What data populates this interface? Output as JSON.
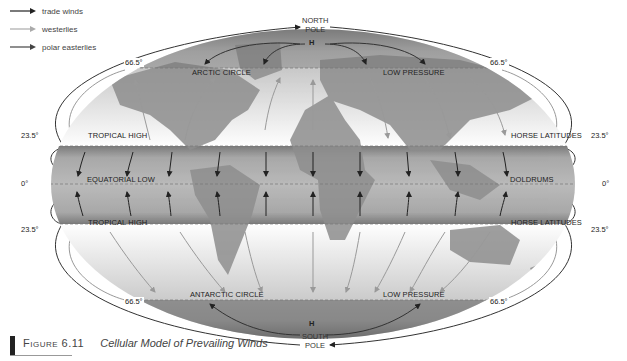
{
  "legend": {
    "items": [
      {
        "label": "trade winds",
        "color": "#222222"
      },
      {
        "label": "westerlies",
        "color": "#9a9a9a"
      },
      {
        "label": "polar easterlies",
        "color": "#444444"
      }
    ]
  },
  "poles": {
    "north": {
      "line1": "NORTH",
      "line2": "POLE",
      "pressure": "H"
    },
    "south": {
      "line1": "SOUTH",
      "line2": "POLE",
      "pressure": "H"
    }
  },
  "latitudes": {
    "n66": "66.5°",
    "n23": "23.5°",
    "eq": "0°",
    "s23": "23.5°",
    "s66": "66.5°"
  },
  "zones": {
    "arctic_circle": "ARCTIC CIRCLE",
    "low_pressure_north": "LOW PRESSURE",
    "tropical_high_north": "TROPICAL HIGH",
    "horse_latitudes_north": "HORSE LATITUDES",
    "equatorial_low": "EQUATORIAL LOW",
    "doldrums": "DOLDRUMS",
    "tropical_high_south": "TROPICAL HIGH",
    "horse_latitudes_south": "HORSE LATITUDES",
    "antarctic_circle": "ANTARCTIC CIRCLE",
    "low_pressure_south": "LOW PRESSURE"
  },
  "caption": {
    "figure": "Figure 6.11",
    "title": "Cellular Model of Prevailing Winds"
  },
  "colors": {
    "tropical_band": "#9c9c9c",
    "land": "#8a8a8a",
    "polar": "#6a6a6a",
    "background": "#ffffff"
  }
}
